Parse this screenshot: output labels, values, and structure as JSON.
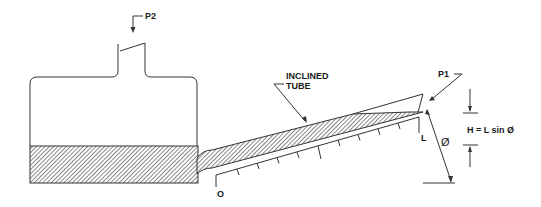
{
  "diagram": {
    "labels": {
      "p2": "P2",
      "p1": "P1",
      "inclined_tube_line1": "INCLINED",
      "inclined_tube_line2": "TUBE",
      "scale_origin": "O",
      "scale_length": "L",
      "angle": "Ø",
      "formula": "H = L sin Ø"
    },
    "colors": {
      "line": "#333333",
      "fill_hatch": "#555555",
      "background": "#ffffff"
    }
  }
}
